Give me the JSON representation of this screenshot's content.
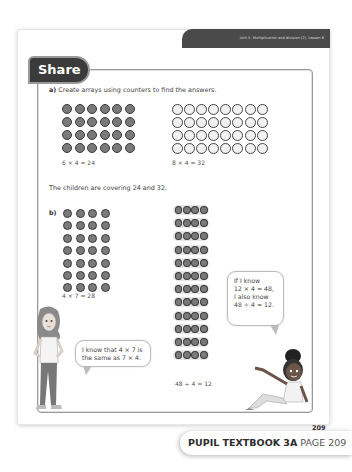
{
  "header": {
    "unit_title": "Unit 5: Multiplication and division (2), Lesson 6"
  },
  "section": {
    "title": "Share"
  },
  "part_a": {
    "label": "a)",
    "instruction": "Create arrays using counters to find the answers.",
    "arrays": [
      {
        "columns": 6,
        "rows": 4,
        "counter_color": "grey",
        "equation": "6 × 4 = 24"
      },
      {
        "columns": 8,
        "rows": 4,
        "counter_color": "white",
        "equation": "8 × 4 = 32"
      }
    ],
    "summary": "The children are covering 24 and 32."
  },
  "part_b": {
    "label": "b)",
    "arrays": [
      {
        "columns": 4,
        "rows": 7,
        "counter_color": "grey",
        "equation": "4 × 7 = 28"
      },
      {
        "columns": 4,
        "rows": 12,
        "counter_color": "grey",
        "style": "strips",
        "equation": "48 ÷ 4 = 12"
      }
    ]
  },
  "speech_bubbles": {
    "right": "If I know\n12 × 4 = 48,\nI also know\n48 ÷ 4 = 12.",
    "left": "I know that 4 × 7 is\nthe same as 7 × 4."
  },
  "characters": {
    "left": "girl-standing",
    "right": "girl-sitting-pointing"
  },
  "page_number": "209",
  "footer": {
    "book": "PUPIL TEXTBOOK 3A",
    "page": "PAGE 209"
  },
  "colors": {
    "header_bg": "#4a4a4a",
    "tab_bg": "#3b3b3b",
    "counter_grey": "#7a7a7a",
    "counter_border": "#3a3a3a",
    "frame_border": "#9a9a9a"
  }
}
